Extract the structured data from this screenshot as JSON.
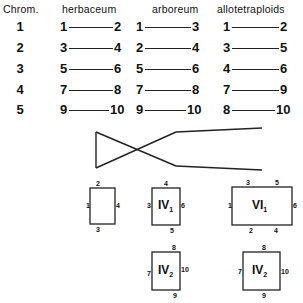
{
  "headers": {
    "chrom": "Chrom.",
    "herbaceum": "herbaceum",
    "arboreum": "arboreum",
    "allotetraploids": "allotetraploids"
  },
  "rows": [
    {
      "chrom": "1",
      "herbaceum": [
        "1",
        "2"
      ],
      "arboreum": [
        "1",
        "3"
      ],
      "allotetraploids": [
        "1",
        "2"
      ]
    },
    {
      "chrom": "2",
      "herbaceum": [
        "3",
        "4"
      ],
      "arboreum": [
        "2",
        "4"
      ],
      "allotetraploids": [
        "3",
        "5"
      ]
    },
    {
      "chrom": "3",
      "herbaceum": [
        "5",
        "6"
      ],
      "arboreum": [
        "5",
        "6"
      ],
      "allotetraploids": [
        "4",
        "6"
      ]
    },
    {
      "chrom": "4",
      "herbaceum": [
        "7",
        "8"
      ],
      "arboreum": [
        "7",
        "8"
      ],
      "allotetraploids": [
        "7",
        "9"
      ]
    },
    {
      "chrom": "5",
      "herbaceum": [
        "9",
        "10"
      ],
      "arboreum": [
        "9",
        "10"
      ],
      "allotetraploids": [
        "8",
        "10"
      ]
    }
  ],
  "configurations": {
    "ring_plain": {
      "top": "2",
      "left": "1",
      "right": "4",
      "bottom": "3"
    },
    "iv1": {
      "label": "IV",
      "sub": "1",
      "top": "4",
      "left": "3",
      "right": "6",
      "bottom": "5"
    },
    "vi1": {
      "label": "VI",
      "sub": "1",
      "top_left": "3",
      "top_right": "5",
      "left": "1",
      "right": "6",
      "bottom_left": "2",
      "bottom_right": "4"
    },
    "iv2_a": {
      "label": "IV",
      "sub": "2",
      "top": "8",
      "left": "7",
      "right": "10",
      "bottom": "9"
    },
    "iv2_b": {
      "label": "IV",
      "sub": "2",
      "top": "8",
      "left": "7",
      "right": "10",
      "bottom": "9"
    }
  }
}
